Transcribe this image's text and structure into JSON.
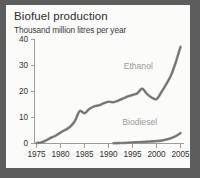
{
  "chart_data": {
    "type": "line",
    "title": "Biofuel production",
    "subtitle": "Thousand million litres per year",
    "xlabel": "",
    "ylabel": "",
    "ylim": [
      0,
      42
    ],
    "xlim": [
      1975,
      2006
    ],
    "grid": false,
    "legend_position": "inline-annotation",
    "ytick_labels": [
      "0",
      "10",
      "20",
      "30",
      "40"
    ],
    "ytick_values": [
      0,
      10,
      20,
      30,
      40
    ],
    "xtick_labels": [
      "1975",
      "1980",
      "1985",
      "1990",
      "1995",
      "2000",
      "2005"
    ],
    "xtick_values": [
      1975,
      1980,
      1985,
      1990,
      1995,
      2000,
      2005
    ],
    "series": [
      {
        "name": "Ethanol",
        "color": "#8e8e8e",
        "x": [
          1975,
          1976,
          1977,
          1978,
          1979,
          1980,
          1981,
          1982,
          1983,
          1984,
          1985,
          1986,
          1987,
          1988,
          1989,
          1990,
          1991,
          1992,
          1993,
          1994,
          1995,
          1996,
          1997,
          1998,
          1999,
          2000,
          2001,
          2002,
          2003,
          2004,
          2005
        ],
        "values": [
          0.2,
          0.4,
          1.2,
          2.2,
          3.0,
          4.2,
          5.2,
          6.4,
          8.6,
          12.4,
          11.6,
          13.2,
          14.2,
          14.6,
          15.4,
          16.0,
          15.8,
          16.4,
          17.2,
          18.0,
          18.6,
          19.2,
          21.0,
          19.0,
          17.6,
          17.0,
          19.6,
          22.6,
          26.0,
          31.0,
          37.0
        ]
      },
      {
        "name": "Biodiesel",
        "color": "#8e8e8e",
        "x": [
          1991,
          1992,
          1993,
          1994,
          1995,
          1996,
          1997,
          1998,
          1999,
          2000,
          2001,
          2002,
          2003,
          2004,
          2005
        ],
        "values": [
          0.1,
          0.15,
          0.2,
          0.3,
          0.4,
          0.5,
          0.6,
          0.7,
          0.8,
          0.9,
          1.1,
          1.5,
          2.0,
          2.8,
          4.0
        ]
      }
    ],
    "annotations": [
      {
        "text": "Ethanol",
        "x": 1996.2,
        "y": 28.5
      },
      {
        "text": "Biodiesel",
        "x": 1996.5,
        "y": 7.2
      }
    ]
  },
  "colors": {
    "page_background": "#5d5d5d",
    "card_background": "#fbfbfa",
    "axis": "#9d9d9d",
    "line": "#8e8e8e",
    "label_text": "#303030",
    "annotation_text": "#9a9a9a",
    "title_text": "#2c2c2c"
  }
}
